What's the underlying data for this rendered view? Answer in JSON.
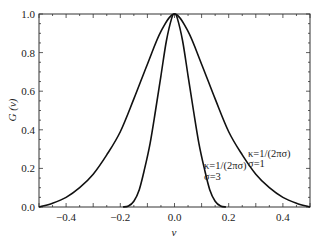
{
  "chart_data": {
    "type": "line",
    "title": "",
    "xlabel": "v",
    "ylabel": "G (v)",
    "xlim": [
      -0.5,
      0.5
    ],
    "ylim": [
      0.0,
      1.0
    ],
    "grid": false,
    "x_ticks": [
      "-0.4",
      "-0.2",
      "0.0",
      "0.2",
      "0.4"
    ],
    "y_ticks": [
      "0.0",
      "0.2",
      "0.4",
      "0.6",
      "0.8",
      "1.0"
    ],
    "series": [
      {
        "name": "κ=1/(2πσ), σ=1",
        "x": [
          -0.5,
          -0.45,
          -0.4,
          -0.35,
          -0.3,
          -0.25,
          -0.2,
          -0.15,
          -0.1,
          -0.05,
          0.0,
          0.05,
          0.1,
          0.15,
          0.2,
          0.25,
          0.3,
          0.35,
          0.4,
          0.45,
          0.5
        ],
        "y": [
          0.0,
          0.02,
          0.05,
          0.1,
          0.17,
          0.27,
          0.39,
          0.56,
          0.74,
          0.91,
          1.0,
          0.91,
          0.74,
          0.56,
          0.39,
          0.27,
          0.17,
          0.1,
          0.05,
          0.02,
          0.0
        ]
      },
      {
        "name": "κ=1/(2πσ), σ=3",
        "x": [
          -0.19,
          -0.17,
          -0.15,
          -0.13,
          -0.11,
          -0.09,
          -0.07,
          -0.05,
          -0.03,
          -0.01,
          0.0,
          0.01,
          0.03,
          0.05,
          0.07,
          0.09,
          0.11,
          0.13,
          0.15,
          0.17,
          0.19
        ],
        "y": [
          0.0,
          0.005,
          0.03,
          0.09,
          0.2,
          0.33,
          0.5,
          0.68,
          0.86,
          0.98,
          1.0,
          0.98,
          0.86,
          0.68,
          0.5,
          0.33,
          0.2,
          0.09,
          0.03,
          0.005,
          0.0
        ]
      }
    ],
    "annotations": [
      {
        "line1": "κ=1/(2πσ)",
        "line2": "σ=1",
        "x": 0.32,
        "y": 0.33
      },
      {
        "line1": "κ=1/(2πσ)",
        "line2": "σ=3",
        "x": 0.19,
        "y": 0.2
      }
    ]
  },
  "labels": {
    "xlabel": "v",
    "ylabel": "G (v)",
    "annot_sigma1_l1": "κ=1/(2πσ)",
    "annot_sigma1_l2": "σ=1",
    "annot_sigma3_l1": "κ=1/(2πσ)",
    "annot_sigma3_l2": "σ=3"
  }
}
